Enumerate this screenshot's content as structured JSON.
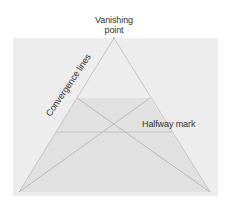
{
  "diagram": {
    "labels": {
      "vanishing_point": "Vanishing\npoint",
      "vanishing_point_line1": "Vanishing",
      "vanishing_point_line2": "point",
      "convergence_lines": "Convergence lines",
      "halfway_mark": "Halfway mark"
    },
    "colors": {
      "background_panel": "#ededed",
      "trapezoid_fill": "#e2e2e2",
      "lines": "#b5b5b5",
      "text": "#333333"
    },
    "geometry": {
      "panel": {
        "x": 13,
        "y": 38,
        "w": 205,
        "h": 158
      },
      "vanishing_point": {
        "x": 114,
        "y": 38
      },
      "base_left": {
        "x": 19,
        "y": 192
      },
      "base_right": {
        "x": 210,
        "y": 192
      },
      "trapezoid_top_left": {
        "x": 77,
        "y": 98
      },
      "trapezoid_top_right": {
        "x": 150,
        "y": 98
      },
      "halfway_y": 132,
      "halfway_x1": 57,
      "halfway_x2": 172
    }
  }
}
